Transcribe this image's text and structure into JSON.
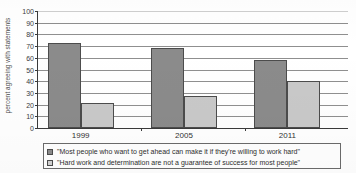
{
  "chart_data": {
    "type": "bar",
    "title": "",
    "subtitle": "",
    "xlabel": "",
    "ylabel": "percent agreeing with statements",
    "categories": [
      "1999",
      "2005",
      "2011"
    ],
    "series": [
      {
        "name": "\"Most people who want to get ahead can make it if they're willing to work hard\"",
        "color": "#8b8b8b",
        "values": [
          73,
          68,
          58
        ]
      },
      {
        "name": "\"Hard work and determination are not a guarantee of success for most people\"",
        "color": "#c9c9c9",
        "values": [
          21,
          27,
          40
        ]
      }
    ],
    "ylim": [
      0,
      100
    ],
    "ytick_step": 10,
    "yticks": [
      0,
      10,
      20,
      30,
      40,
      50,
      60,
      70,
      80,
      90,
      100
    ],
    "ytick_labels": [
      "0",
      "10",
      "20",
      "30",
      "40",
      "50",
      "60",
      "70",
      "80",
      "90",
      "100"
    ],
    "grid": true,
    "grid_axis": "y",
    "legend_position": "bottom",
    "legend_boxed": true,
    "orientation": "vertical",
    "bar_edge_color": "#4c4c4c",
    "axis_color": "#3a3a3a",
    "gridline_color": "#8f8f8f",
    "background": "#ffffff"
  },
  "legend": {
    "items": [
      {
        "swatch_name": "legend-swatch-series-1",
        "label": "\"Most people who want to get ahead can make it if they're willing to work hard\""
      },
      {
        "swatch_name": "legend-swatch-series-2",
        "label": "\"Hard work and determination are not a guarantee of success for most people\""
      }
    ]
  }
}
